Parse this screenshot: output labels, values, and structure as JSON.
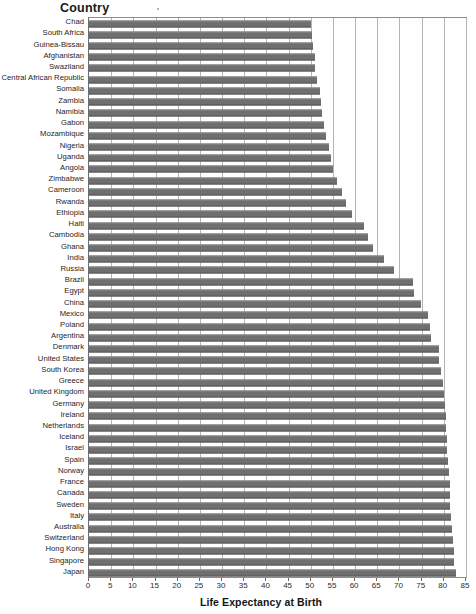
{
  "header": {
    "country_label": "Country"
  },
  "axis": {
    "x_title": "Life Expectancy at Birth",
    "x_ticks": [
      0,
      5,
      10,
      15,
      20,
      25,
      30,
      35,
      40,
      45,
      50,
      55,
      60,
      65,
      70,
      75,
      80,
      85
    ]
  },
  "style": {
    "bar_color": "#6f6f6f",
    "grid_color": "#b4b4b4",
    "frame_color": "#8d8d8d",
    "background": "#ffffff"
  },
  "chart_data": {
    "type": "bar",
    "orientation": "horizontal",
    "title": "",
    "subtitle": "",
    "xlabel": "Life Expectancy at Birth",
    "ylabel": "Country",
    "xlim": [
      0,
      85
    ],
    "xtick_step": 5,
    "grid": true,
    "legend": null,
    "categories": [
      "Chad",
      "South Africa",
      "Guinea-Bissau",
      "Afghanistan",
      "Swaziland",
      "Central African Republic",
      "Somalia",
      "Zambia",
      "Namibia",
      "Gabon",
      "Mozambique",
      "Nigeria",
      "Uganda",
      "Angola",
      "Zimbabwe",
      "Cameroon",
      "Rwanda",
      "Ethiopia",
      "Haiti",
      "Cambodia",
      "Ghana",
      "India",
      "Russia",
      "Brazil",
      "Egypt",
      "China",
      "Mexico",
      "Poland",
      "Argentina",
      "Denmark",
      "United States",
      "South Korea",
      "Greece",
      "United Kingdom",
      "Germany",
      "Ireland",
      "Netherlands",
      "Iceland",
      "Israel",
      "Spain",
      "Norway",
      "France",
      "Canada",
      "Sweden",
      "Italy",
      "Australia",
      "Switzerland",
      "Hong Kong",
      "Singapore",
      "Japan"
    ],
    "values": [
      50.0,
      50.2,
      50.6,
      50.9,
      51.0,
      51.4,
      52.0,
      52.3,
      52.5,
      53.0,
      53.4,
      54.0,
      54.5,
      55.0,
      56.0,
      57.0,
      58.0,
      59.3,
      62.0,
      63.0,
      64.0,
      66.5,
      68.8,
      73.0,
      73.3,
      74.8,
      76.5,
      76.8,
      77.0,
      78.8,
      79.0,
      79.3,
      79.8,
      80.0,
      80.2,
      80.4,
      80.5,
      80.7,
      80.8,
      81.0,
      81.1,
      81.3,
      81.4,
      81.5,
      81.7,
      81.8,
      82.0,
      82.2,
      82.4,
      82.7
    ]
  }
}
